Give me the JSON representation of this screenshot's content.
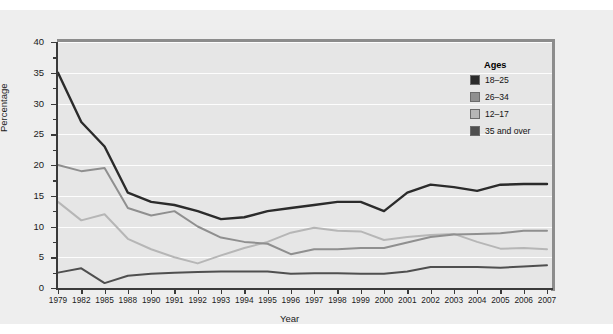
{
  "chart_data": {
    "type": "line",
    "title": "",
    "xlabel": "Year",
    "ylabel": "Percentage",
    "ylim": [
      0,
      40
    ],
    "ytick_values": [
      0,
      5,
      10,
      15,
      20,
      25,
      30,
      35,
      40
    ],
    "ytick_labels": [
      "0",
      "5",
      "10",
      "15",
      "20",
      "25",
      "30",
      "35",
      "40"
    ],
    "grid": true,
    "legend_position": "upper right",
    "legend_title": "Ages",
    "categories": [
      "1979",
      "1982",
      "1985",
      "1988",
      "1990",
      "1991",
      "1992",
      "1993",
      "1994",
      "1995",
      "1996",
      "1997",
      "1998",
      "1999",
      "2000",
      "2001",
      "2002",
      "2003",
      "2004",
      "2005",
      "2006",
      "2007"
    ],
    "series": [
      {
        "name": "18–25",
        "color": "#2b2b2b",
        "values": [
          35.0,
          27.0,
          23.0,
          15.5,
          14.0,
          13.5,
          12.5,
          11.2,
          11.5,
          12.5,
          13.0,
          13.5,
          14.0,
          14.0,
          12.5,
          15.5,
          16.8,
          16.4,
          15.8,
          16.8,
          16.9,
          16.9
        ]
      },
      {
        "name": "26–34",
        "color": "#8f8f8f",
        "values": [
          20.0,
          19.0,
          19.5,
          13.0,
          11.8,
          12.5,
          10.0,
          8.2,
          7.5,
          7.2,
          5.5,
          6.3,
          6.3,
          6.5,
          6.5,
          7.4,
          8.3,
          8.7,
          8.8,
          8.9,
          9.3,
          9.3
        ]
      },
      {
        "name": "12–17",
        "color": "#b6b6b6",
        "values": [
          14.0,
          11.0,
          12.0,
          8.0,
          6.3,
          5.0,
          4.0,
          5.3,
          6.5,
          7.5,
          9.0,
          9.8,
          9.3,
          9.2,
          7.8,
          8.3,
          8.6,
          8.8,
          7.5,
          6.4,
          6.5,
          6.3
        ]
      },
      {
        "name": "35 and over",
        "color": "#4f4f4f",
        "values": [
          2.5,
          3.2,
          0.8,
          2.0,
          2.3,
          2.5,
          2.6,
          2.7,
          2.7,
          2.7,
          2.3,
          2.4,
          2.4,
          2.3,
          2.3,
          2.7,
          3.4,
          3.4,
          3.4,
          3.3,
          3.5,
          3.7
        ]
      }
    ]
  },
  "legend": {
    "title": "Ages",
    "entries": [
      {
        "label": "18–25",
        "swatch": "#2b2b2b"
      },
      {
        "label": "26–34",
        "swatch": "#8f8f8f"
      },
      {
        "label": "12–17",
        "swatch": "#b6b6b6"
      },
      {
        "label": "35 and over",
        "swatch": "#4f4f4f"
      }
    ]
  },
  "axes": {
    "y_title": "Percentage",
    "x_title": "Year"
  }
}
